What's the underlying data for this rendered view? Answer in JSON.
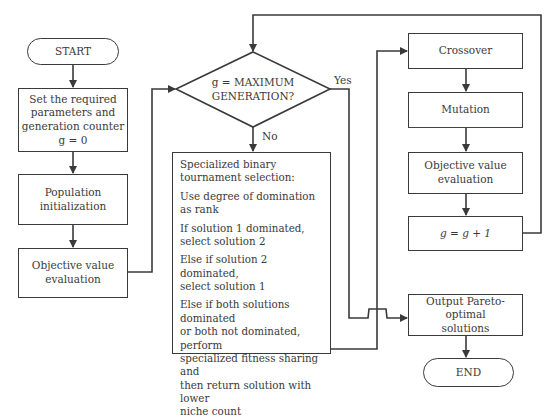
{
  "diagram": {
    "nodes": {
      "start": "START",
      "set_params": "Set the required\nparameters and\ngeneration counter\ng = 0",
      "population_init": "Population initialization",
      "objective_eval_left": "Objective value\nevaluation",
      "decision": "g = MAXIMUM\nGENERATION?",
      "selection": [
        "Specialized binary\ntournament selection:",
        "Use degree of domination\nas rank",
        "If solution 1 dominated,\nselect solution 2",
        "Else if solution 2 dominated,\nselect solution 1",
        "Else if both solutions dominated\nor both not dominated, perform\nspecialized fitness sharing and\nthen return solution with lower\nniche count"
      ],
      "crossover": "Crossover",
      "mutation": "Mutation",
      "objective_eval_right": "Objective value\nevaluation",
      "increment": "g = g + 1",
      "output": "Output Pareto-optimal\nsolutions",
      "end": "END"
    },
    "edge_labels": {
      "yes": "Yes",
      "no": "No"
    },
    "colors": {
      "line": "#3a3a3a",
      "background": "#ffffff"
    }
  }
}
